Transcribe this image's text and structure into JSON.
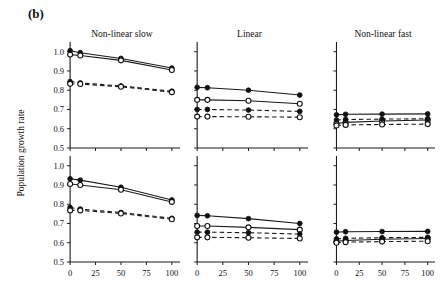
{
  "figure": {
    "panel_letter": "(b)",
    "ylabel": "Population growth rate"
  },
  "chart_data": {
    "type": "line",
    "title": "(b)",
    "xlabel": "",
    "ylabel": "Population growth rate",
    "xlim": [
      -6,
      108
    ],
    "ylim": [
      0.5,
      1.04
    ],
    "grid": false,
    "legend": "none",
    "x": [
      0,
      10,
      50,
      100
    ],
    "xticks": [
      0,
      25,
      50,
      75,
      100
    ],
    "yticks": [
      0.5,
      0.6,
      0.7,
      0.8,
      0.9,
      1.0
    ],
    "ytick_labels": [
      "0.5",
      "0.6",
      "0.7",
      "0.8",
      "0.9",
      "1.0"
    ],
    "xtick_labels": [
      "0",
      "25",
      "50",
      "75",
      "100"
    ],
    "column_titles": [
      "Non-linear slow",
      "Linear",
      "Non-linear fast"
    ],
    "series_styles": [
      {
        "name": "solid-filled",
        "line": "solid",
        "marker": "filled-circle"
      },
      {
        "name": "solid-open",
        "line": "solid",
        "marker": "open-circle"
      },
      {
        "name": "dashed-filled",
        "line": "dashed",
        "marker": "filled-circle"
      },
      {
        "name": "dashed-open",
        "line": "dashed",
        "marker": "open-circle"
      }
    ],
    "panels": [
      {
        "row": 0,
        "col": 0,
        "title": "Non-linear slow",
        "y_axis_labeled": true,
        "series": [
          {
            "name": "solid-filled",
            "values": [
              1.005,
              0.995,
              0.965,
              0.915
            ]
          },
          {
            "name": "solid-open",
            "values": [
              0.985,
              0.98,
              0.955,
              0.905
            ]
          },
          {
            "name": "dashed-filled",
            "values": [
              0.845,
              0.838,
              0.822,
              0.795
            ]
          },
          {
            "name": "dashed-open",
            "values": [
              0.833,
              0.832,
              0.818,
              0.79
            ]
          }
        ]
      },
      {
        "row": 0,
        "col": 1,
        "title": "Linear",
        "y_axis_labeled": false,
        "series": [
          {
            "name": "solid-filled",
            "values": [
              0.815,
              0.813,
              0.8,
              0.775
            ]
          },
          {
            "name": "solid-open",
            "values": [
              0.75,
              0.75,
              0.745,
              0.73
            ]
          },
          {
            "name": "dashed-filled",
            "values": [
              0.7,
              0.7,
              0.697,
              0.69
            ]
          },
          {
            "name": "dashed-open",
            "values": [
              0.663,
              0.663,
              0.662,
              0.66
            ]
          }
        ]
      },
      {
        "row": 0,
        "col": 2,
        "title": "Non-linear fast",
        "y_axis_labeled": false,
        "series": [
          {
            "name": "solid-filled",
            "values": [
              0.672,
              0.675,
              0.676,
              0.677
            ]
          },
          {
            "name": "solid-open",
            "values": [
              0.627,
              0.633,
              0.64,
              0.645
            ]
          },
          {
            "name": "dashed-filled",
            "values": [
              0.645,
              0.648,
              0.65,
              0.652
            ]
          },
          {
            "name": "dashed-open",
            "values": [
              0.617,
              0.62,
              0.622,
              0.624
            ]
          }
        ]
      },
      {
        "row": 1,
        "col": 0,
        "title": "",
        "y_axis_labeled": true,
        "series": [
          {
            "name": "solid-filled",
            "values": [
              0.932,
              0.925,
              0.888,
              0.822
            ]
          },
          {
            "name": "solid-open",
            "values": [
              0.905,
              0.9,
              0.875,
              0.812
            ]
          },
          {
            "name": "dashed-filled",
            "values": [
              0.783,
              0.775,
              0.757,
              0.727
            ]
          },
          {
            "name": "dashed-open",
            "values": [
              0.768,
              0.768,
              0.752,
              0.722
            ]
          }
        ]
      },
      {
        "row": 1,
        "col": 1,
        "title": "",
        "y_axis_labeled": false,
        "series": [
          {
            "name": "solid-filled",
            "values": [
              0.742,
              0.74,
              0.725,
              0.7
            ]
          },
          {
            "name": "solid-open",
            "values": [
              0.687,
              0.687,
              0.68,
              0.668
            ]
          },
          {
            "name": "dashed-filled",
            "values": [
              0.655,
              0.655,
              0.652,
              0.645
            ]
          },
          {
            "name": "dashed-open",
            "values": [
              0.628,
              0.628,
              0.626,
              0.622
            ]
          }
        ]
      },
      {
        "row": 1,
        "col": 2,
        "title": "",
        "y_axis_labeled": false,
        "series": [
          {
            "name": "solid-filled",
            "values": [
              0.655,
              0.657,
              0.658,
              0.659
            ]
          },
          {
            "name": "solid-open",
            "values": [
              0.608,
              0.612,
              0.618,
              0.622
            ]
          },
          {
            "name": "dashed-filled",
            "values": [
              0.62,
              0.623,
              0.626,
              0.628
            ]
          },
          {
            "name": "dashed-open",
            "values": [
              0.6,
              0.603,
              0.606,
              0.608
            ]
          }
        ]
      }
    ]
  }
}
